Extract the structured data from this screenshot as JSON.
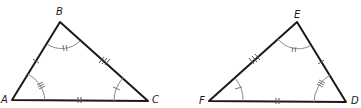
{
  "diagram": {
    "type": "congruent-triangles",
    "triangles": [
      {
        "name": "ABC",
        "vertices": [
          {
            "label": "A",
            "x": 12,
            "y": 100
          },
          {
            "label": "B",
            "x": 60,
            "y": 22
          },
          {
            "label": "C",
            "x": 148,
            "y": 101
          }
        ],
        "side_marks": {
          "AB": 1,
          "BC": 3,
          "AC": 2
        },
        "angle_marks": {
          "A": 3,
          "B": 2,
          "C": 1
        }
      },
      {
        "name": "DEF",
        "vertices": [
          {
            "label": "F",
            "x": 209,
            "y": 101
          },
          {
            "label": "E",
            "x": 297,
            "y": 22
          },
          {
            "label": "D",
            "x": 346,
            "y": 102
          }
        ],
        "side_marks": {
          "FE": 3,
          "ED": 1,
          "FD": 2
        },
        "angle_marks": {
          "F": 1,
          "E": 2,
          "D": 3
        }
      }
    ],
    "labels": {
      "A": "A",
      "B": "B",
      "C": "C",
      "D": "D",
      "E": "E",
      "F": "F"
    },
    "colors": {
      "sides": "#1a1a1a",
      "arcs": "#8a8a8a",
      "background": "#ffffff"
    }
  }
}
